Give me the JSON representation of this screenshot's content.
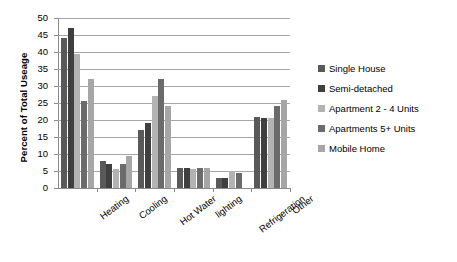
{
  "chart_data": {
    "type": "bar",
    "title": "",
    "xlabel": "",
    "ylabel": "Percent of Total Useage",
    "ylim": [
      0,
      50
    ],
    "ytick_step": 5,
    "yticks": [
      0,
      5,
      10,
      15,
      20,
      25,
      30,
      35,
      40,
      45,
      50
    ],
    "grid": "horizontal",
    "legend_position": "right",
    "categories": [
      "Heating",
      "Cooling",
      "Hot Water",
      "lighting",
      "Refrigeration",
      "Other"
    ],
    "series": [
      {
        "name": "Single House",
        "color": "#595959",
        "values": [
          44.0,
          8.0,
          17.0,
          6.0,
          3.0,
          21.0
        ]
      },
      {
        "name": "Semi-detached",
        "color": "#3f3f3f",
        "values": [
          47.0,
          7.0,
          19.0,
          6.0,
          3.0,
          20.5
        ]
      },
      {
        "name": "Apartment 2 - 4 Units",
        "color": "#b3b3b3",
        "values": [
          39.5,
          5.5,
          27.0,
          5.5,
          5.0,
          20.5
        ]
      },
      {
        "name": "Apartments 5+ Units",
        "color": "#6b6b6b",
        "values": [
          25.5,
          7.0,
          32.0,
          6.0,
          4.5,
          24.0
        ]
      },
      {
        "name": "Mobile Home",
        "color": "#a6a6a6",
        "values": [
          32.0,
          9.5,
          24.0,
          6.0,
          0.0,
          26.0
        ]
      }
    ]
  },
  "axis": {
    "y_title": "Percent of Total Useage"
  },
  "legend": {
    "items": [
      {
        "label": "Single House",
        "color": "#595959"
      },
      {
        "label": "Semi-detached",
        "color": "#3f3f3f"
      },
      {
        "label": "Apartment 2 - 4 Units",
        "color": "#b3b3b3"
      },
      {
        "label": "Apartments 5+ Units",
        "color": "#6b6b6b"
      },
      {
        "label": "Mobile Home",
        "color": "#a6a6a6"
      }
    ]
  }
}
